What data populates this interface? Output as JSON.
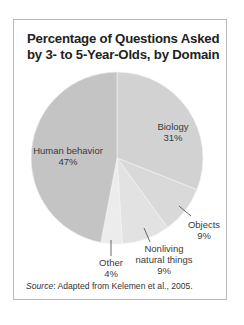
{
  "chart_data": {
    "type": "pie",
    "title": "Percentage of Questions Asked by 3- to 5-Year-Olds, by Domain",
    "title_lines": [
      "Percentage of Questions Asked",
      "by 3- to 5-Year-Olds, by Domain"
    ],
    "categories": [
      "Biology",
      "Objects",
      "Nonliving natural things",
      "Other",
      "Human behavior"
    ],
    "values": [
      31,
      9,
      9,
      4,
      47
    ],
    "unit": "%",
    "colors": [
      "#d2d2d2",
      "#d9d9d9",
      "#e2e2e2",
      "#ececec",
      "#c4c4c4"
    ],
    "labels": {
      "biology": {
        "name": "Biology",
        "value": "31%"
      },
      "objects": {
        "name": "Objects",
        "value": "9%"
      },
      "nonliving": {
        "name_line1": "Nonliving",
        "name_line2": "natural things",
        "value": "9%"
      },
      "other": {
        "name": "Other",
        "value": "4%"
      },
      "human": {
        "name": "Human behavior",
        "value": "47%"
      }
    },
    "source_label": "Source",
    "source_text": ": Adapted from Kelemen et al., 2005."
  }
}
